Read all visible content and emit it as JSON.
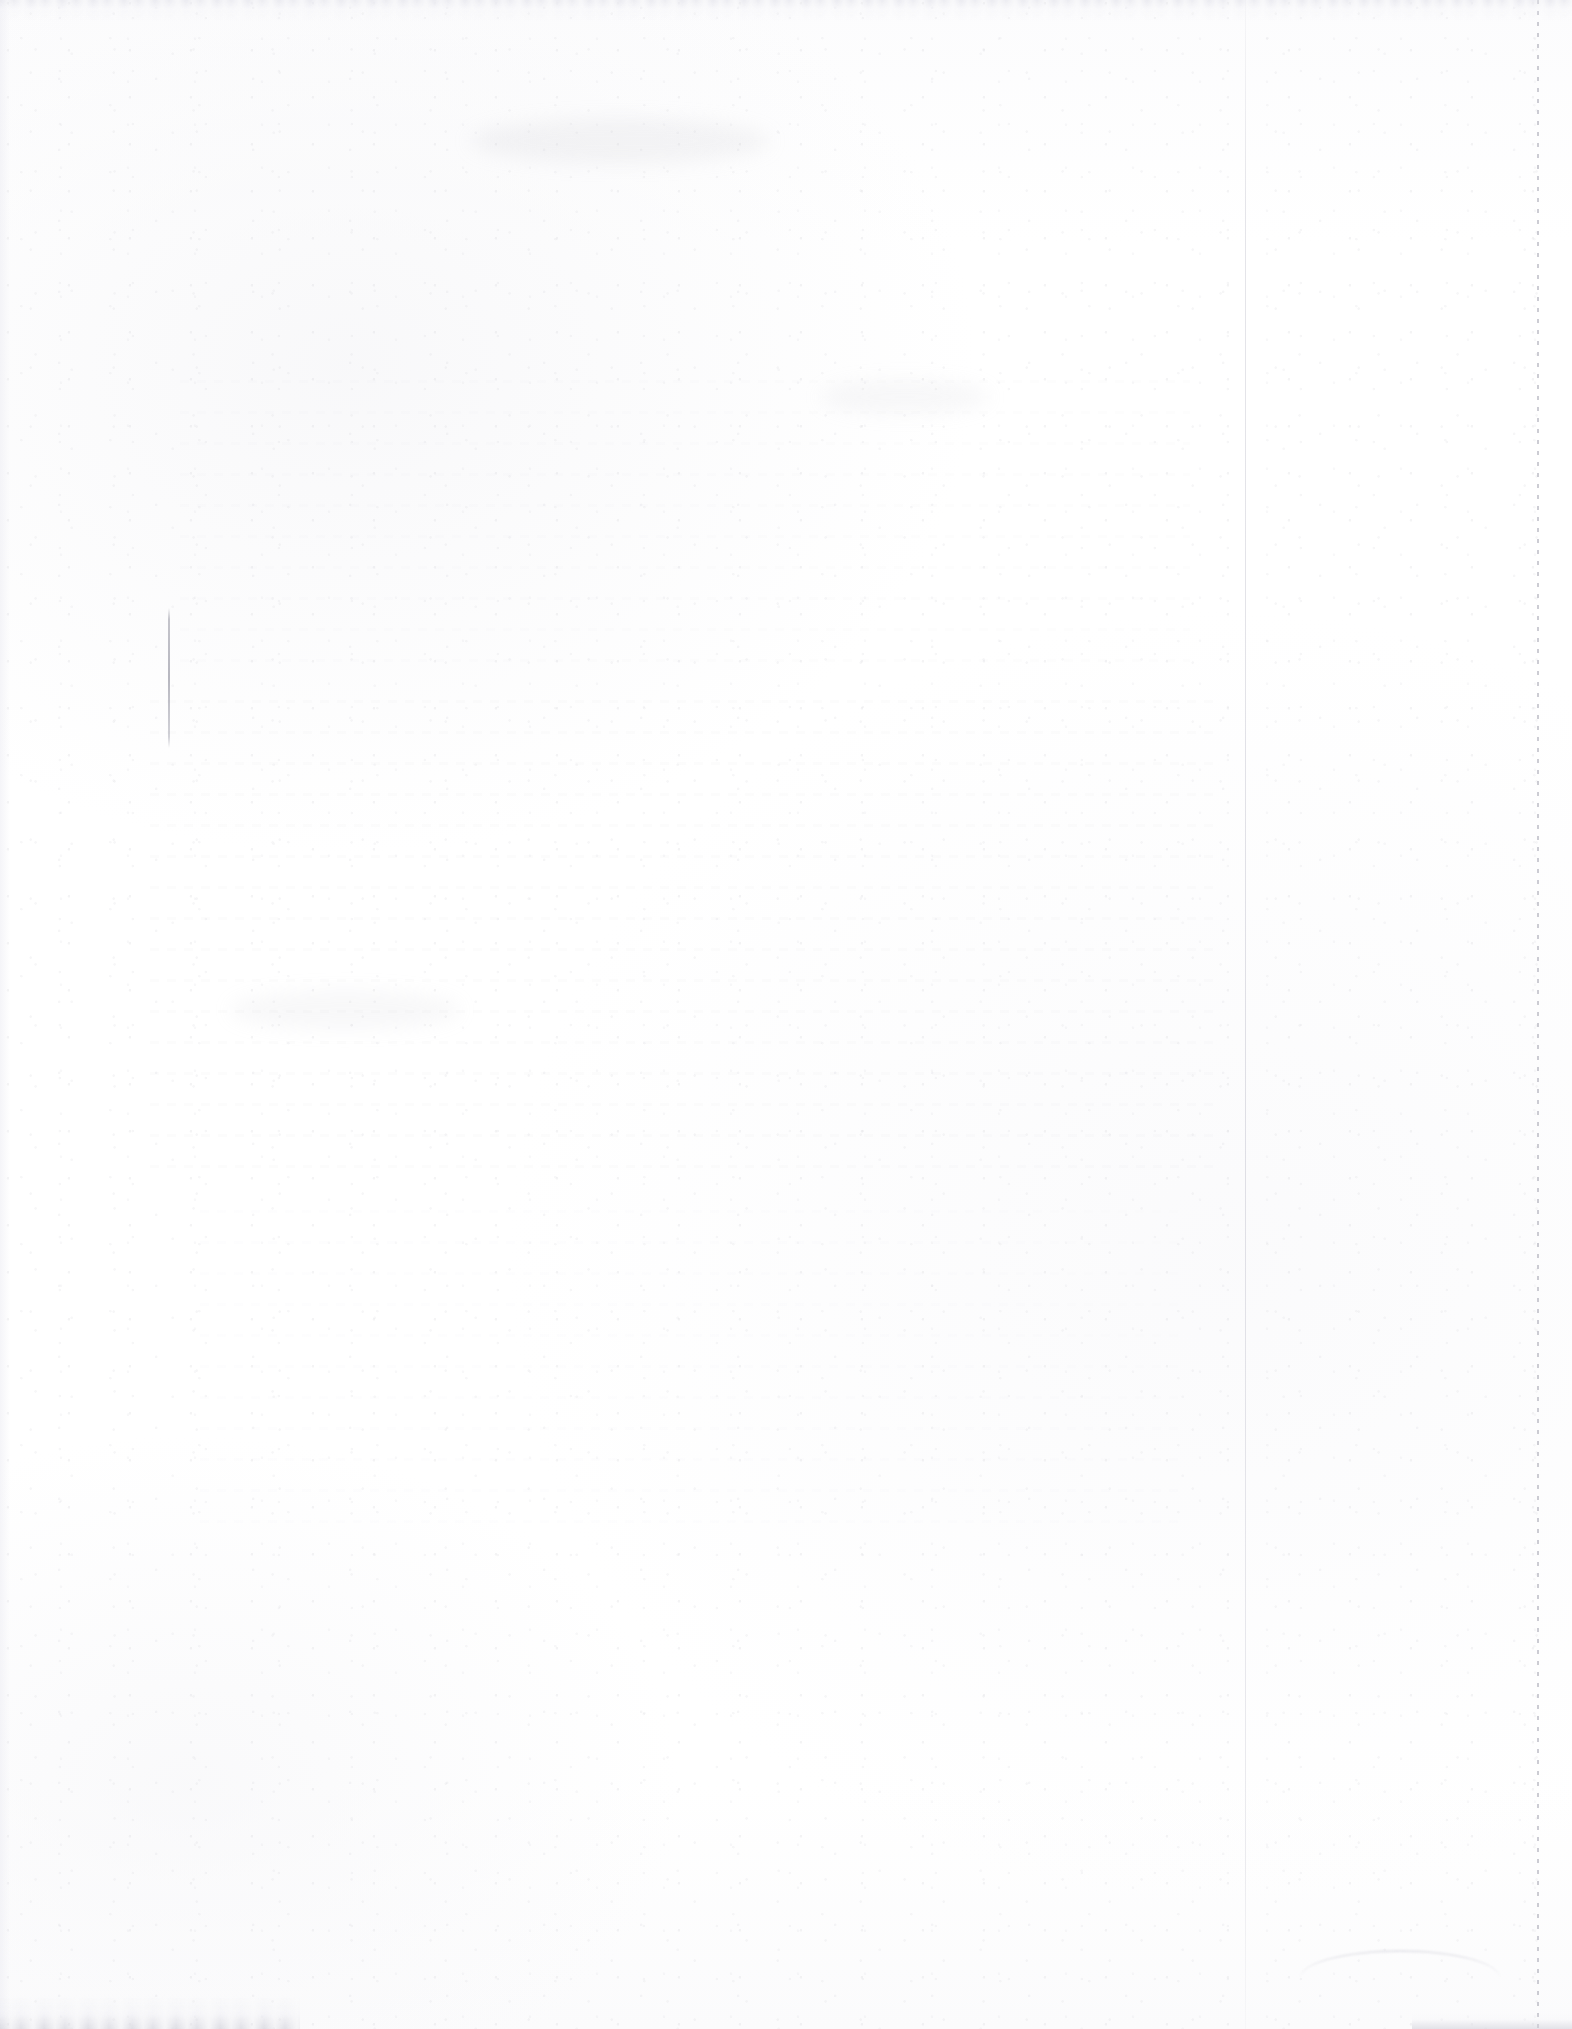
{
  "document": {
    "kind": "scanned-page",
    "content_state": "blank",
    "visible_text": "",
    "page_width_px": 1572,
    "page_height_px": 2029,
    "accessible_description": "Blank scanned document page with no legible text",
    "colors": {
      "paper_white": "#ffffff",
      "paper_offwhite": "#fcfcfd",
      "grain_gray": "#cdcdd2",
      "pen_mark_gray": "#8c8c9a",
      "fold_line_gray": "#b6b6c4",
      "perforation_gray": "#a8a8b4",
      "torn_edge_gray": "#e8e8ee"
    }
  },
  "artifacts": {
    "pen_stroke": {
      "name": "vertical-pen-stroke",
      "x": 168,
      "y": 608,
      "width": 2,
      "height": 140
    },
    "fold_line": {
      "name": "vertical-fold-line",
      "x": 1245,
      "width": 1
    },
    "perforation_line": {
      "name": "dotted-perforation-line",
      "x": 1537,
      "width": 2
    },
    "edges": {
      "top": "torn",
      "bottom_left": "torn",
      "bottom_right": "rough",
      "left": "soft"
    },
    "ghost_bands": [
      {
        "name": "ghost-text-band-upper",
        "x": 180,
        "y": 380,
        "width": 1010,
        "height": 300
      },
      {
        "name": "ghost-text-band-middle",
        "x": 150,
        "y": 700,
        "width": 1070,
        "height": 480
      },
      {
        "name": "ghost-text-band-lower",
        "x": 200,
        "y": 1210,
        "width": 980,
        "height": 330
      }
    ]
  }
}
